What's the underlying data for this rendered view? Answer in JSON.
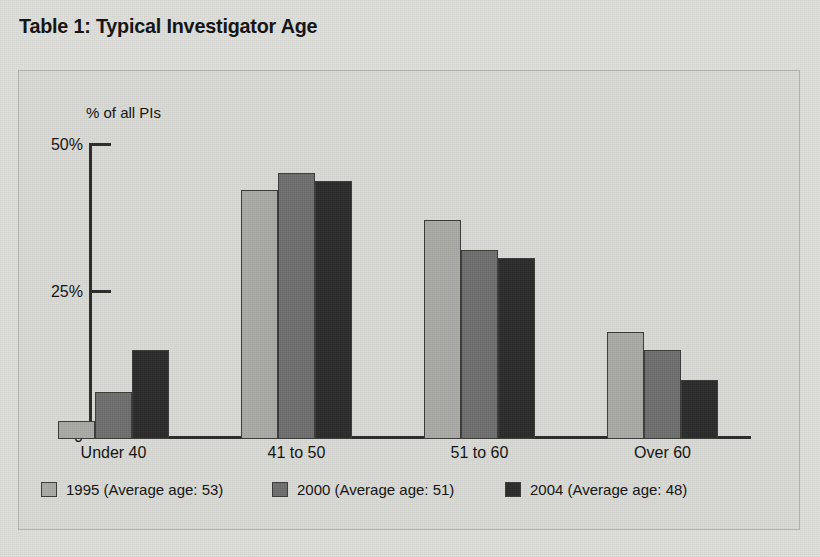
{
  "title": "Table 1: Typical Investigator Age",
  "chart_data": {
    "type": "bar",
    "title": "Table 1: Typical Investigator Age",
    "xlabel": "",
    "ylabel": "% of all PIs",
    "ylim": [
      0,
      50
    ],
    "yticks": [
      "0",
      "25%",
      "50%"
    ],
    "grid": false,
    "legend_position": "bottom",
    "categories": [
      "Under 40",
      "41 to 50",
      "51 to 60",
      "Over 60"
    ],
    "series": [
      {
        "name": "1995 (Average age: 53)",
        "year": "1995",
        "average_age": "53",
        "color": "#a9a9a6",
        "values": [
          3,
          42,
          37,
          18
        ]
      },
      {
        "name": "2000 (Average age: 51)",
        "year": "2000",
        "average_age": "51",
        "color": "#6e6e6e",
        "values": [
          8,
          45,
          32,
          15
        ]
      },
      {
        "name": "2004 (Average age: 48)",
        "year": "2004",
        "average_age": "48",
        "color": "#2b2b2b",
        "values": [
          15,
          43.5,
          30.5,
          10
        ]
      }
    ]
  }
}
